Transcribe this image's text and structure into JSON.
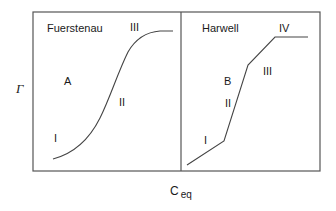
{
  "figure": {
    "y_axis_label": "Γ",
    "x_axis_label_main": "C",
    "x_axis_label_sub": "eq",
    "colors": {
      "line": "#444444",
      "frame": "#555555",
      "text": "#1a1a1a"
    }
  },
  "panels": [
    {
      "title": "Fuerstenau",
      "region_labels": {
        "A": "A",
        "I": "I",
        "II": "II",
        "III": "III"
      },
      "curve_type": "smooth S-shaped"
    },
    {
      "title": "Harwell",
      "region_labels": {
        "B": "B",
        "I": "I",
        "II": "II",
        "III": "III",
        "IV": "IV"
      },
      "curve_type": "piecewise linear"
    }
  ]
}
